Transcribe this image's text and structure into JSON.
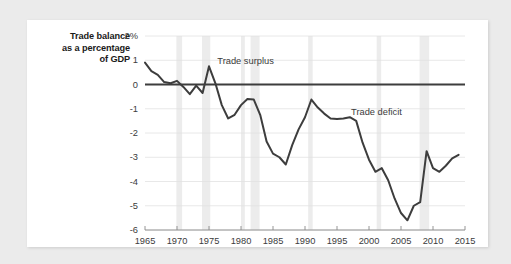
{
  "figure": {
    "background_color": "#ebebeb",
    "card_color": "#ffffff",
    "line_color": "#3d3d3d",
    "grid_color": "#e2e2e2",
    "recession_band_color": "#ececec",
    "axis_color": "#8a8a8a"
  },
  "axis_title": {
    "line1": "Trade balance",
    "line2": "as a percentage",
    "line3": "of GDP"
  },
  "annotations": {
    "surplus": "Trade surplus",
    "deficit": "Trade deficit"
  },
  "chart_data": {
    "type": "line",
    "title": "",
    "subtitle": "",
    "xlabel": "",
    "ylabel": "Trade balance as a percentage of GDP",
    "xlim": [
      1965,
      2015
    ],
    "ylim": [
      -6,
      2
    ],
    "grid": true,
    "legend_position": "none",
    "ytick_labels": [
      "2%",
      "1",
      "0",
      "-1",
      "-2",
      "-3",
      "-4",
      "-5",
      "-6"
    ],
    "ytick_values": [
      2,
      1,
      0,
      -1,
      -2,
      -3,
      -4,
      -5,
      -6
    ],
    "xtick_labels": [
      "1965",
      "1970",
      "1975",
      "1980",
      "1985",
      "1990",
      "1995",
      "2000",
      "2005",
      "2010",
      "2015"
    ],
    "xtick_values": [
      1965,
      1970,
      1975,
      1980,
      1985,
      1990,
      1995,
      2000,
      2005,
      2010,
      2015
    ],
    "zero_line": 0,
    "annotations": [
      {
        "text": "Trade surplus",
        "x": 1976.3,
        "y": 0.95
      },
      {
        "text": "Trade deficit",
        "x": 1997.2,
        "y": -1.12
      }
    ],
    "shaded_bands": [
      {
        "label": "recession",
        "start": 1969.9,
        "end": 1970.8
      },
      {
        "label": "recession",
        "start": 1973.9,
        "end": 1975.2
      },
      {
        "label": "recession",
        "start": 1980.0,
        "end": 1980.6
      },
      {
        "label": "recession",
        "start": 1981.5,
        "end": 1982.9
      },
      {
        "label": "recession",
        "start": 1990.5,
        "end": 1991.2
      },
      {
        "label": "recession",
        "start": 2001.2,
        "end": 2001.9
      },
      {
        "label": "recession",
        "start": 2007.9,
        "end": 2009.4
      }
    ],
    "series": [
      {
        "name": "Trade balance (% of GDP)",
        "color": "#3d3d3d",
        "x": [
          1965,
          1966,
          1967,
          1968,
          1969,
          1970,
          1971,
          1972,
          1973,
          1974,
          1975,
          1976,
          1977,
          1978,
          1979,
          1980,
          1981,
          1982,
          1983,
          1984,
          1985,
          1986,
          1987,
          1988,
          1989,
          1990,
          1991,
          1992,
          1993,
          1994,
          1995,
          1996,
          1997,
          1998,
          1999,
          2000,
          2001,
          2002,
          2003,
          2004,
          2005,
          2006,
          2007,
          2008,
          2009,
          2010,
          2011,
          2012,
          2013,
          2014
        ],
        "values": [
          0.9,
          0.55,
          0.4,
          0.1,
          0.05,
          0.15,
          -0.1,
          -0.4,
          -0.05,
          -0.35,
          0.75,
          0.05,
          -0.85,
          -1.4,
          -1.25,
          -0.85,
          -0.6,
          -0.62,
          -1.25,
          -2.35,
          -2.85,
          -3.0,
          -3.3,
          -2.5,
          -1.85,
          -1.35,
          -0.62,
          -0.95,
          -1.2,
          -1.4,
          -1.42,
          -1.4,
          -1.35,
          -1.5,
          -2.4,
          -3.1,
          -3.6,
          -3.45,
          -3.95,
          -4.7,
          -5.3,
          -5.6,
          -5.0,
          -4.85,
          -2.75,
          -3.45,
          -3.6,
          -3.35,
          -3.05,
          -2.9
        ]
      }
    ]
  }
}
